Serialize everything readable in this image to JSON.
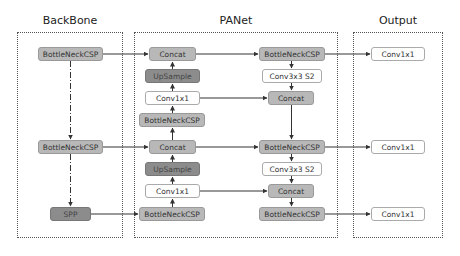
{
  "groups": {
    "backbone": {
      "title": "BackBone"
    },
    "panet": {
      "title": "PANet"
    },
    "output": {
      "title": "Output"
    }
  },
  "backbone": {
    "nodes": [
      {
        "label": "BottleNeckCSP",
        "style": "light"
      },
      {
        "label": "BottleNeckCSP",
        "style": "light"
      },
      {
        "label": "SPP",
        "style": "dark"
      }
    ]
  },
  "panet": {
    "left": [
      {
        "label": "Concat",
        "style": "light"
      },
      {
        "label": "UpSample",
        "style": "dark"
      },
      {
        "label": "Conv1x1",
        "style": "white"
      },
      {
        "label": "BottleNeckCSP",
        "style": "light"
      },
      {
        "label": "Concat",
        "style": "light"
      },
      {
        "label": "UpSample",
        "style": "dark"
      },
      {
        "label": "Conv1x1",
        "style": "white"
      },
      {
        "label": "BottleNeckCSP",
        "style": "light"
      }
    ],
    "right": [
      {
        "label": "BottleNeckCSP",
        "style": "light"
      },
      {
        "label": "Conv3x3 S2",
        "style": "white"
      },
      {
        "label": "Concat",
        "style": "light"
      },
      {
        "label": "BottleNeckCSP",
        "style": "light"
      },
      {
        "label": "Conv3x3 S2",
        "style": "white"
      },
      {
        "label": "Concat",
        "style": "light"
      },
      {
        "label": "BottleNeckCSP",
        "style": "light"
      }
    ]
  },
  "output": {
    "nodes": [
      {
        "label": "Conv1x1",
        "style": "white"
      },
      {
        "label": "Conv1x1",
        "style": "white"
      },
      {
        "label": "Conv1x1",
        "style": "white"
      }
    ]
  },
  "colors": {
    "white_node": "#ffffff",
    "light_node": "#b8b8b8",
    "dark_node": "#8c8c8c",
    "line": "#333333"
  }
}
